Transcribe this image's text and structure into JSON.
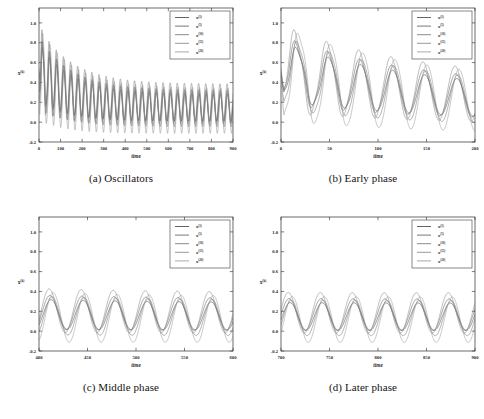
{
  "figure": {
    "ylabel": "x^(k)",
    "xlabel": "time",
    "y_ticks": [
      "1.0",
      "0.8",
      "0.6",
      "0.4",
      "0.2",
      "0.0",
      "-0.2"
    ],
    "y_tick_values": [
      1.0,
      0.8,
      0.6,
      0.4,
      0.2,
      0.0,
      -0.2
    ],
    "ylim": [
      -0.2,
      1.15
    ],
    "series_colors": [
      "#3a3a3a",
      "#555555",
      "#6b6b6b",
      "#808080",
      "#949494"
    ],
    "legend_entries": [
      {
        "base": "x",
        "sup": "(1)"
      },
      {
        "base": "x",
        "sup": "(5)"
      },
      {
        "base": "x",
        "sup": "(10)"
      },
      {
        "base": "x",
        "sup": "(15)"
      },
      {
        "base": "x",
        "sup": "(20)"
      }
    ]
  },
  "panels": [
    {
      "id": "a",
      "caption": "(a) Oscillators",
      "xlim": [
        0,
        900
      ],
      "x_ticks": [
        0,
        100,
        200,
        300,
        400,
        500,
        600,
        700,
        800,
        900
      ],
      "x_tick_labels": [
        "0",
        "100",
        "200",
        "300",
        "400",
        "500",
        "600",
        "700",
        "800",
        "900"
      ]
    },
    {
      "id": "b",
      "caption": "(b) Early phase",
      "xlim": [
        0,
        200
      ],
      "x_ticks": [
        0,
        50,
        100,
        150,
        200
      ],
      "x_tick_labels": [
        "0",
        "50",
        "100",
        "150",
        "200"
      ]
    },
    {
      "id": "c",
      "caption": "(c) Middle phase",
      "xlim": [
        400,
        600
      ],
      "x_ticks": [
        400,
        450,
        500,
        550,
        600
      ],
      "x_tick_labels": [
        "400",
        "450",
        "500",
        "550",
        "600"
      ]
    },
    {
      "id": "d",
      "caption": "(d) Later phase",
      "xlim": [
        700,
        900
      ],
      "x_ticks": [
        700,
        750,
        800,
        850,
        900
      ],
      "x_tick_labels": [
        "700",
        "750",
        "800",
        "850",
        "900"
      ]
    }
  ],
  "chart_data": {
    "type": "line",
    "title": "",
    "xlabel": "time",
    "ylabel": "x^(k)",
    "ylim": [
      -0.2,
      1.15
    ],
    "grid": false,
    "legend_position": "upper right",
    "n_series": 5,
    "series_names": [
      "x^(1)",
      "x^(5)",
      "x^(10)",
      "x^(15)",
      "x^(20)"
    ],
    "model": {
      "note": "Trajectories generated as damped-then-sustained sinusoids; parameters below reproduce the plotted curves.",
      "period": 33.0,
      "offset_initial": 0.5,
      "offset_final": 0.135,
      "offset_decay_time": 150.0,
      "amplitude_initial": 0.36,
      "amplitude_final": 0.175,
      "amplitude_decay_time": 170.0,
      "series_params": [
        {
          "name": "x^(1)",
          "phase": 0.0,
          "amp_scale": 0.78,
          "offset_shift": 0.01,
          "start": 0.5
        },
        {
          "name": "x^(5)",
          "phase": 0.22,
          "amp_scale": 0.9,
          "offset_shift": 0.03,
          "start": 0.52
        },
        {
          "name": "x^(10)",
          "phase": -0.18,
          "amp_scale": 1.0,
          "offset_shift": -0.005,
          "start": 0.47
        },
        {
          "name": "x^(15)",
          "phase": 0.38,
          "amp_scale": 1.15,
          "offset_shift": 0.048,
          "start": 0.55
        },
        {
          "name": "x^(20)",
          "phase": -0.4,
          "amp_scale": 1.3,
          "offset_shift": -0.02,
          "start": 0.44
        }
      ],
      "transient_wobble": {
        "amplitude": 0.055,
        "period": 11.0,
        "decay_time": 45.0
      }
    },
    "read_values": {
      "panel_a": {
        "first_peak": {
          "t": 18,
          "y": 0.8
        },
        "second_peak": {
          "t": 52,
          "y": 0.87
        },
        "first_trough": {
          "t": 36,
          "y": 0.15
        },
        "steady_peak_range": [
          0.3,
          0.44
        ],
        "steady_trough_range": [
          -0.12,
          0.02
        ]
      },
      "panel_b": {
        "start_y": 0.5,
        "peaks": [
          {
            "t": 18,
            "y": 0.74
          },
          {
            "t": 62,
            "y": 0.87
          },
          {
            "t": 102,
            "y": 0.5
          },
          {
            "t": 140,
            "y": 0.42
          },
          {
            "t": 180,
            "y": 0.44
          }
        ],
        "troughs": [
          {
            "t": 38,
            "y": 0.15
          },
          {
            "t": 82,
            "y": 0.02
          },
          {
            "t": 122,
            "y": -0.06
          },
          {
            "t": 160,
            "y": 0.08
          },
          {
            "t": 198,
            "y": 0.06
          }
        ]
      },
      "panel_c": {
        "n_cycles": 6,
        "peak_range": [
          0.28,
          0.4
        ],
        "trough_range": [
          -0.1,
          0.02
        ]
      },
      "panel_d": {
        "n_cycles": 6,
        "peak_range": [
          0.22,
          0.33
        ],
        "trough_range": [
          -0.1,
          0.02
        ]
      }
    }
  }
}
